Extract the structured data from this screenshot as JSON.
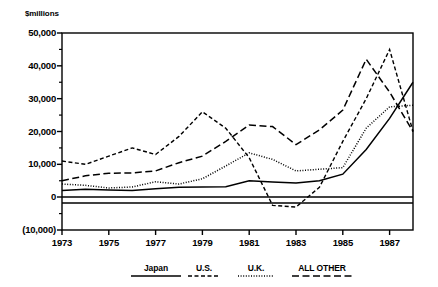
{
  "chart_data": {
    "type": "line",
    "title": "",
    "subtitle": "",
    "xlabel": "",
    "ylabel": "$millions",
    "unit_label": "$millions",
    "x": [
      1973,
      1974,
      1975,
      1976,
      1977,
      1978,
      1979,
      1980,
      1981,
      1982,
      1983,
      1984,
      1985,
      1986,
      1987,
      1988
    ],
    "xlim": [
      1973,
      1988
    ],
    "ylim": [
      -10000,
      50000
    ],
    "grid": false,
    "legend_position": "bottom",
    "x_tick_labels": [
      "1973",
      "1975",
      "1977",
      "1979",
      "1981",
      "1983",
      "1985",
      "1987"
    ],
    "x_tick_values": [
      1973,
      1975,
      1977,
      1979,
      1981,
      1983,
      1985,
      1987
    ],
    "y_tick_labels": [
      "50,000",
      "40,000",
      "30,000",
      "20,000",
      "10,000",
      "0",
      "(10,000)"
    ],
    "y_tick_values": [
      50000,
      40000,
      30000,
      20000,
      10000,
      0,
      -10000
    ],
    "y_minor_tick_values": [
      45000,
      35000,
      25000,
      15000,
      5000,
      -5000
    ],
    "zero_line": 0,
    "series": [
      {
        "name": "Japan",
        "style": "solid",
        "values": [
          2000,
          2400,
          2200,
          2000,
          2600,
          3000,
          3100,
          3200,
          5000,
          4600,
          4300,
          5000,
          7000,
          14500,
          24000,
          35000
        ]
      },
      {
        "name": "U.S.",
        "style": "dashed",
        "values": [
          11000,
          10000,
          12500,
          15000,
          13000,
          18500,
          26000,
          21000,
          12000,
          -2500,
          -3000,
          3000,
          17000,
          30000,
          45000,
          20000
        ]
      },
      {
        "name": "U.K.",
        "style": "dotted",
        "values": [
          4000,
          3600,
          2800,
          3100,
          4700,
          4000,
          5600,
          9500,
          13500,
          11500,
          8000,
          8500,
          9000,
          21000,
          27500,
          28000
        ]
      },
      {
        "name": "ALL OTHER",
        "style": "longdash",
        "values": [
          5000,
          6500,
          7300,
          7400,
          8000,
          10500,
          12500,
          17000,
          22000,
          21500,
          16000,
          20500,
          26500,
          42000,
          32000,
          20000
        ]
      }
    ]
  },
  "legend": {
    "items": [
      {
        "label": "Japan",
        "style": "solid"
      },
      {
        "label": "U.S.",
        "style": "dashed"
      },
      {
        "label": "U.K.",
        "style": "dotted"
      },
      {
        "label": "ALL OTHER",
        "style": "longdash"
      }
    ]
  }
}
